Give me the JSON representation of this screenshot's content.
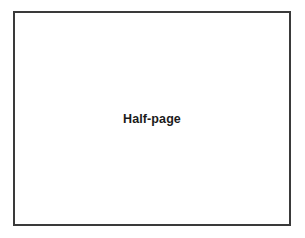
{
  "canvas": {
    "width": 305,
    "height": 238,
    "background_color": "#ffffff"
  },
  "frame": {
    "label": "Half-page",
    "border_color": "#3a3a3a",
    "fill_color": "#ffffff",
    "border_width_px": 2,
    "left_px": 13,
    "top_px": 11,
    "width_px": 278,
    "height_px": 215
  },
  "label_style": {
    "color": "#1b1b1b",
    "font_size_px": 12.5,
    "weight": "bold",
    "align": "center"
  }
}
